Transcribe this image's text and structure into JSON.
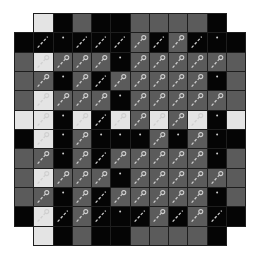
{
  "game": {
    "title": "Tile board",
    "colors": {
      "black": "#050505",
      "gray": "#5b5b5b",
      "light": "#e4e4e4",
      "grid_line": "#1e1e1e",
      "glyph": "#cfcfcf"
    },
    "legend": {
      "B": "black tile",
      "G": "gray tile",
      "L": "light tile",
      "_": "empty",
      "w": "wand-icon",
      "k": "key-icon",
      "d": "dot-icon"
    },
    "rows": [
      [
        "_",
        "L",
        "B",
        "G",
        "B",
        "B",
        "G",
        "G",
        "G",
        "G",
        "B",
        "_"
      ],
      [
        "B",
        "Bw",
        "Bd",
        "Bw",
        "Bw",
        "Bw",
        "Gk",
        "Bw",
        "Gk",
        "Bw",
        "Bd",
        "B"
      ],
      [
        "G",
        "Lk",
        "Gk",
        "Gk",
        "Gk",
        "Bd",
        "Gk",
        "Gk",
        "Gk",
        "Gk",
        "Gk",
        "G"
      ],
      [
        "G",
        "Gk",
        "Bd",
        "Gk",
        "Bw",
        "Gk",
        "Gk",
        "Gk",
        "Gk",
        "Gk",
        "Bd",
        "G"
      ],
      [
        "G",
        "Lk",
        "Gk",
        "Gk",
        "Gk",
        "Bd",
        "Gk",
        "Gk",
        "Gk",
        "Gk",
        "Gk",
        "G"
      ],
      [
        "L",
        "Lk",
        "Bd",
        "Lk",
        "Bw",
        "Lk",
        "Gk",
        "Lk",
        "Gk",
        "Lk",
        "Bd",
        "L"
      ],
      [
        "B",
        "Lk",
        "Bd",
        "Gk",
        "Bd",
        "Bd",
        "Bd",
        "Gk",
        "Bd",
        "Gk",
        "Bd",
        "B"
      ],
      [
        "G",
        "Gk",
        "Bd",
        "Gk",
        "Bw",
        "Gk",
        "Gk",
        "Gk",
        "Gk",
        "Gk",
        "Bd",
        "G"
      ],
      [
        "G",
        "Lk",
        "Gk",
        "Gk",
        "Gk",
        "Bd",
        "Gk",
        "Gk",
        "Gk",
        "Gk",
        "Gk",
        "G"
      ],
      [
        "G",
        "Gk",
        "Bd",
        "Gk",
        "Bw",
        "Gk",
        "Gk",
        "Gk",
        "Gk",
        "Gk",
        "Bd",
        "G"
      ],
      [
        "B",
        "Lk",
        "Bw",
        "Gk",
        "Bw",
        "Bd",
        "Bw",
        "Gk",
        "Bw",
        "Gk",
        "Bw",
        "B"
      ],
      [
        "_",
        "L",
        "B",
        "G",
        "B",
        "B",
        "G",
        "G",
        "G",
        "G",
        "B",
        "_"
      ]
    ]
  }
}
